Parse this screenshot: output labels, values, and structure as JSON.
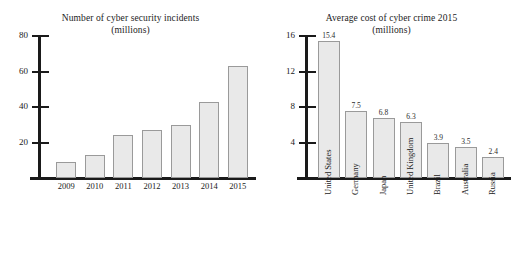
{
  "chart_data": [
    {
      "type": "bar",
      "title": "Number of cyber security incidents",
      "subtitle": "(millions)",
      "xlabel": "",
      "ylabel": "",
      "ylim": [
        0,
        80
      ],
      "yticks": [
        20,
        40,
        60,
        80
      ],
      "grid": false,
      "legend": "none",
      "categories": [
        "2009",
        "2010",
        "2011",
        "2012",
        "2013",
        "2014",
        "2015"
      ],
      "values": [
        9,
        13,
        24,
        27,
        30,
        43,
        63
      ],
      "value_labels_shown": false,
      "bar_fill": "#e9e9e9",
      "bar_edge": "#9a9a9a",
      "axis_color": "#1a1a1a"
    },
    {
      "type": "bar",
      "title": "Average cost of cyber crime 2015",
      "subtitle": "(millions)",
      "xlabel": "",
      "ylabel": "",
      "ylim": [
        0,
        16
      ],
      "yticks": [
        4,
        8,
        12,
        16
      ],
      "grid": false,
      "legend": "none",
      "categories": [
        "United States",
        "Germany",
        "Japan",
        "United Kingdom",
        "Brazil",
        "Australia",
        "Russia"
      ],
      "values": [
        15.4,
        7.5,
        6.8,
        6.3,
        3.9,
        3.5,
        2.4
      ],
      "value_labels": [
        "15.4",
        "7.5",
        "6.8",
        "6.3",
        "3.9",
        "3.5",
        "2.4"
      ],
      "value_labels_shown": true,
      "bar_fill": "#e9e9e9",
      "bar_edge": "#9a9a9a",
      "axis_color": "#1a1a1a"
    }
  ],
  "left_chart": {
    "title_line1": "Number of cyber security incidents",
    "title_line2": "(millions)",
    "yticks": [
      "20",
      "40",
      "60",
      "80"
    ],
    "categories": [
      "2009",
      "2010",
      "2011",
      "2012",
      "2013",
      "2014",
      "2015"
    ]
  },
  "right_chart": {
    "title_line1": "Average cost of cyber crime 2015",
    "title_line2": "(millions)",
    "yticks": [
      "4",
      "8",
      "12",
      "16"
    ],
    "categories": [
      "United States",
      "Germany",
      "Japan",
      "United Kingdom",
      "Brazil",
      "Australia",
      "Russia"
    ],
    "value_labels": [
      "15.4",
      "7.5",
      "6.8",
      "6.3",
      "3.9",
      "3.5",
      "2.4"
    ]
  }
}
